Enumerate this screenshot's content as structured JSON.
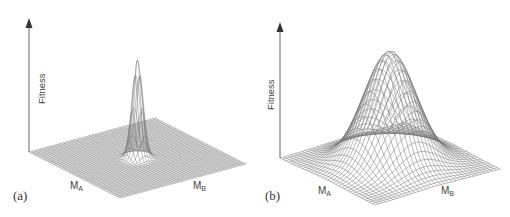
{
  "figure": {
    "panels": [
      {
        "id": "a",
        "tag": "(a)",
        "y_axis_label": "Fitness",
        "x_axis_labels": [
          {
            "main": "M",
            "sub": "A"
          },
          {
            "main": "M",
            "sub": "B"
          }
        ],
        "surface": "sharp narrow peak on flat plane"
      },
      {
        "id": "b",
        "tag": "(b)",
        "y_axis_label": "Fitness",
        "x_axis_labels": [
          {
            "main": "M",
            "sub": "A"
          },
          {
            "main": "M",
            "sub": "B"
          }
        ],
        "surface": "broad smooth gaussian hill"
      }
    ],
    "colors": {
      "mesh": "#777777",
      "axis": "#555555",
      "text": "#444444"
    }
  }
}
